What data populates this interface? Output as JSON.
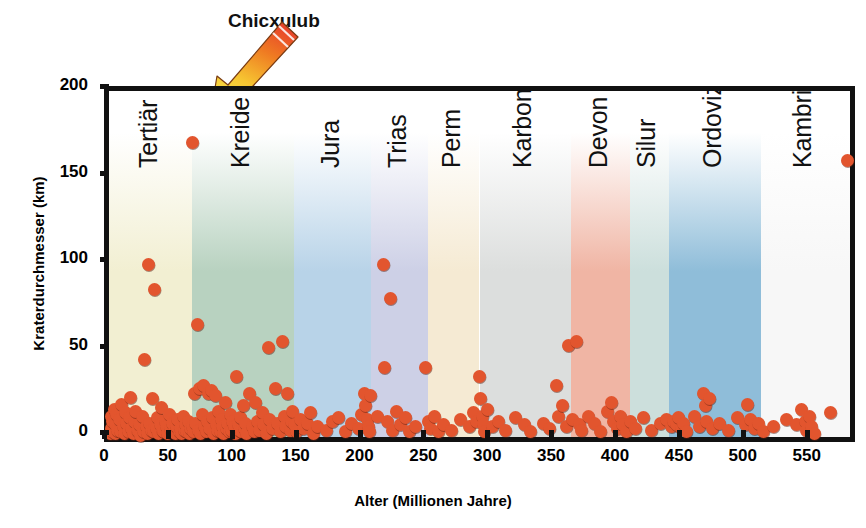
{
  "chart_data": {
    "type": "scatter",
    "title": "",
    "xlabel": "Alter (Millionen Jahre)",
    "ylabel": "Kraterdurchmesser (km)",
    "xlim": [
      0,
      580
    ],
    "ylim": [
      0,
      200
    ],
    "xticks": [
      0,
      50,
      100,
      150,
      200,
      250,
      300,
      350,
      400,
      450,
      500,
      550
    ],
    "yticks": [
      0,
      50,
      100,
      150,
      200
    ],
    "grid": false,
    "legend": null,
    "point_color": "#e2552e",
    "annotations": [
      {
        "text": "Chicxulub",
        "x": 65,
        "y": 170,
        "marker": "arrow"
      }
    ],
    "bands": [
      {
        "label": "Tertiar",
        "label_text": "Tertiär",
        "x_start": 0,
        "x_end": 65,
        "color": "#f2efd2"
      },
      {
        "label": "Kreide",
        "x_start": 65,
        "x_end": 145,
        "color": "#b8d2c0"
      },
      {
        "label": "Jura",
        "x_start": 145,
        "x_end": 205,
        "color": "#b8d3e8"
      },
      {
        "label": "Trias",
        "x_start": 205,
        "x_end": 250,
        "color": "#cdd0e6"
      },
      {
        "label": "Perm",
        "x_start": 250,
        "x_end": 290,
        "color": "#f5ead3"
      },
      {
        "label": "Karbon",
        "x_start": 290,
        "x_end": 362,
        "color": "#dcdedd"
      },
      {
        "label": "Devon",
        "x_start": 362,
        "x_end": 408,
        "color": "#f0b5a4"
      },
      {
        "label": "Silur",
        "x_start": 408,
        "x_end": 438,
        "color": "#ccdfdc"
      },
      {
        "label": "Ordovizium",
        "x_start": 438,
        "x_end": 510,
        "color": "#8fbdd9"
      },
      {
        "label": "Kambrium",
        "x_start": 510,
        "x_end": 580,
        "color": "#f7f7f7"
      }
    ],
    "points": [
      [
        1,
        2
      ],
      [
        2,
        5
      ],
      [
        2,
        12
      ],
      [
        3,
        3
      ],
      [
        3,
        9
      ],
      [
        4,
        16
      ],
      [
        5,
        2
      ],
      [
        5,
        7
      ],
      [
        6,
        13
      ],
      [
        7,
        4
      ],
      [
        8,
        10
      ],
      [
        9,
        3
      ],
      [
        10,
        19
      ],
      [
        11,
        6
      ],
      [
        12,
        2
      ],
      [
        13,
        14
      ],
      [
        14,
        8
      ],
      [
        15,
        3
      ],
      [
        16,
        11
      ],
      [
        17,
        23
      ],
      [
        18,
        5
      ],
      [
        19,
        2
      ],
      [
        20,
        9
      ],
      [
        21,
        15
      ],
      [
        22,
        4
      ],
      [
        23,
        3
      ],
      [
        24,
        7
      ],
      [
        25,
        1
      ],
      [
        26,
        12
      ],
      [
        27,
        3
      ],
      [
        28,
        45
      ],
      [
        29,
        6
      ],
      [
        30,
        2
      ],
      [
        31,
        100
      ],
      [
        32,
        8
      ],
      [
        33,
        4
      ],
      [
        34,
        22
      ],
      [
        35,
        3
      ],
      [
        36,
        85
      ],
      [
        37,
        5
      ],
      [
        38,
        11
      ],
      [
        39,
        2
      ],
      [
        40,
        7
      ],
      [
        41,
        17
      ],
      [
        42,
        4
      ],
      [
        43,
        3
      ],
      [
        44,
        9
      ],
      [
        45,
        6
      ],
      [
        46,
        2
      ],
      [
        47,
        13
      ],
      [
        48,
        5
      ],
      [
        49,
        3
      ],
      [
        50,
        8
      ],
      [
        51,
        4
      ],
      [
        52,
        2
      ],
      [
        53,
        6
      ],
      [
        54,
        10
      ],
      [
        55,
        3
      ],
      [
        56,
        5
      ],
      [
        57,
        2
      ],
      [
        58,
        12
      ],
      [
        59,
        4
      ],
      [
        60,
        7
      ],
      [
        61,
        3
      ],
      [
        62,
        9
      ],
      [
        63,
        2
      ],
      [
        64,
        5
      ],
      [
        65,
        170
      ],
      [
        65,
        6
      ],
      [
        66,
        3
      ],
      [
        67,
        25
      ],
      [
        68,
        8
      ],
      [
        69,
        65
      ],
      [
        70,
        4
      ],
      [
        71,
        28
      ],
      [
        72,
        2
      ],
      [
        73,
        13
      ],
      [
        74,
        30
      ],
      [
        75,
        6
      ],
      [
        76,
        3
      ],
      [
        77,
        9
      ],
      [
        78,
        25
      ],
      [
        79,
        5
      ],
      [
        80,
        27
      ],
      [
        81,
        11
      ],
      [
        82,
        2
      ],
      [
        83,
        24
      ],
      [
        84,
        7
      ],
      [
        85,
        4
      ],
      [
        86,
        15
      ],
      [
        87,
        3
      ],
      [
        88,
        10
      ],
      [
        89,
        6
      ],
      [
        90,
        2
      ],
      [
        91,
        20
      ],
      [
        92,
        5
      ],
      [
        93,
        8
      ],
      [
        94,
        3
      ],
      [
        95,
        13
      ],
      [
        96,
        4
      ],
      [
        97,
        9
      ],
      [
        98,
        6
      ],
      [
        99,
        2
      ],
      [
        100,
        35
      ],
      [
        101,
        7
      ],
      [
        102,
        4
      ],
      [
        103,
        11
      ],
      [
        104,
        3
      ],
      [
        105,
        18
      ],
      [
        106,
        5
      ],
      [
        107,
        8
      ],
      [
        108,
        2
      ],
      [
        110,
        25
      ],
      [
        112,
        6
      ],
      [
        114,
        3
      ],
      [
        115,
        20
      ],
      [
        116,
        9
      ],
      [
        118,
        4
      ],
      [
        120,
        14
      ],
      [
        121,
        7
      ],
      [
        123,
        2
      ],
      [
        125,
        52
      ],
      [
        126,
        10
      ],
      [
        128,
        5
      ],
      [
        130,
        28
      ],
      [
        132,
        8
      ],
      [
        134,
        3
      ],
      [
        136,
        55
      ],
      [
        137,
        12
      ],
      [
        138,
        6
      ],
      [
        140,
        25
      ],
      [
        142,
        4
      ],
      [
        143,
        9
      ],
      [
        144,
        15
      ],
      [
        145,
        7
      ],
      [
        147,
        3
      ],
      [
        150,
        10
      ],
      [
        152,
        5
      ],
      [
        155,
        8
      ],
      [
        158,
        14
      ],
      [
        160,
        2
      ],
      [
        163,
        6
      ],
      [
        170,
        4
      ],
      [
        175,
        9
      ],
      [
        180,
        11
      ],
      [
        185,
        3
      ],
      [
        190,
        8
      ],
      [
        195,
        5
      ],
      [
        198,
        13
      ],
      [
        200,
        25
      ],
      [
        201,
        18
      ],
      [
        202,
        10
      ],
      [
        203,
        6
      ],
      [
        204,
        3
      ],
      [
        205,
        24
      ],
      [
        210,
        12
      ],
      [
        215,
        100
      ],
      [
        216,
        40
      ],
      [
        218,
        9
      ],
      [
        220,
        80
      ],
      [
        222,
        4
      ],
      [
        225,
        15
      ],
      [
        228,
        7
      ],
      [
        232,
        11
      ],
      [
        235,
        3
      ],
      [
        240,
        6
      ],
      [
        248,
        40
      ],
      [
        250,
        9
      ],
      [
        252,
        5
      ],
      [
        255,
        12
      ],
      [
        258,
        3
      ],
      [
        262,
        7
      ],
      [
        268,
        4
      ],
      [
        275,
        10
      ],
      [
        282,
        6
      ],
      [
        285,
        14
      ],
      [
        288,
        9
      ],
      [
        290,
        35
      ],
      [
        291,
        22
      ],
      [
        292,
        12
      ],
      [
        293,
        7
      ],
      [
        294,
        3
      ],
      [
        296,
        16
      ],
      [
        300,
        6
      ],
      [
        305,
        9
      ],
      [
        310,
        4
      ],
      [
        318,
        11
      ],
      [
        325,
        7
      ],
      [
        330,
        3
      ],
      [
        340,
        8
      ],
      [
        345,
        5
      ],
      [
        350,
        30
      ],
      [
        352,
        12
      ],
      [
        355,
        18
      ],
      [
        358,
        6
      ],
      [
        360,
        53
      ],
      [
        363,
        10
      ],
      [
        366,
        55
      ],
      [
        368,
        7
      ],
      [
        370,
        4
      ],
      [
        375,
        12
      ],
      [
        380,
        8
      ],
      [
        385,
        3
      ],
      [
        390,
        15
      ],
      [
        393,
        20
      ],
      [
        395,
        9
      ],
      [
        398,
        5
      ],
      [
        400,
        12
      ],
      [
        402,
        7
      ],
      [
        405,
        3
      ],
      [
        408,
        9
      ],
      [
        412,
        5
      ],
      [
        418,
        11
      ],
      [
        425,
        4
      ],
      [
        432,
        8
      ],
      [
        436,
        10
      ],
      [
        440,
        6
      ],
      [
        442,
        9
      ],
      [
        444,
        7
      ],
      [
        446,
        11
      ],
      [
        448,
        5
      ],
      [
        450,
        8
      ],
      [
        452,
        3
      ],
      [
        458,
        12
      ],
      [
        462,
        6
      ],
      [
        465,
        25
      ],
      [
        467,
        18
      ],
      [
        468,
        9
      ],
      [
        470,
        22
      ],
      [
        472,
        5
      ],
      [
        478,
        8
      ],
      [
        485,
        4
      ],
      [
        492,
        11
      ],
      [
        498,
        7
      ],
      [
        500,
        19
      ],
      [
        502,
        10
      ],
      [
        505,
        5
      ],
      [
        508,
        8
      ],
      [
        512,
        3
      ],
      [
        520,
        6
      ],
      [
        530,
        10
      ],
      [
        538,
        7
      ],
      [
        542,
        16
      ],
      [
        545,
        9
      ],
      [
        546,
        4
      ],
      [
        548,
        12
      ],
      [
        550,
        6
      ],
      [
        552,
        2
      ],
      [
        565,
        14
      ],
      [
        578,
        160
      ]
    ]
  },
  "annotation": {
    "label": "Chicxulub",
    "arrow_colors": {
      "top": "#e8452a",
      "mid": "#f08a22",
      "bottom": "#f7e64a"
    }
  }
}
